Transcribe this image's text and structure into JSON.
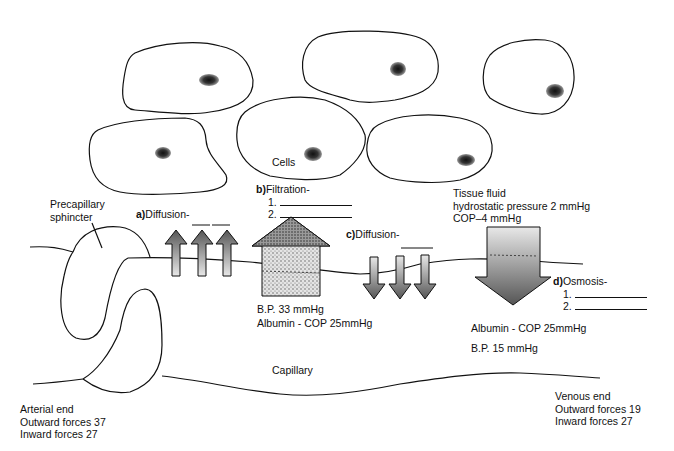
{
  "cells": {
    "label": "Cells",
    "count": 6
  },
  "precapillary": {
    "label_line1": "Precapillary",
    "label_line2": "sphincter"
  },
  "diffusion_a": {
    "marker": "a)",
    "label": "Diffusion-"
  },
  "filtration_b": {
    "marker": "b)",
    "label": "Filtration-",
    "item1": "1.",
    "item2": "2."
  },
  "diffusion_c": {
    "marker": "c)",
    "label": "Diffusion-"
  },
  "tissue_fluid": {
    "line1": "Tissue fluid",
    "line2": "hydrostatic pressure 2 mmHg",
    "line3": "COP–4 mmHg"
  },
  "osmosis_d": {
    "marker": "d)",
    "label": "Osmosis-",
    "item1": "1.",
    "item2": "2."
  },
  "arterial_pressures": {
    "bp": "B.P.  33 mmHg",
    "cop": "Albumin - COP  25mmHg"
  },
  "venous_pressures": {
    "cop": "Albumin - COP 25mmHg",
    "bp": "B.P.  15 mmHg"
  },
  "capillary": {
    "label": "Capillary"
  },
  "arterial_end": {
    "title": "Arterial end",
    "outward": "Outward forces 37",
    "inward": "Inward forces 27"
  },
  "venous_end": {
    "title": "Venous end",
    "outward": "Outward forces 19",
    "inward": "Inward forces 27"
  }
}
